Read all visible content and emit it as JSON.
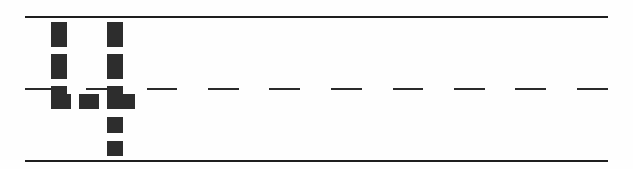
{
  "glyph": {
    "character": "4",
    "ink_color": "#2d2d2d",
    "line_color": "#1e1e1e",
    "background": "#fefefe"
  },
  "guides": {
    "top_line_y": 16,
    "midline_y": 88,
    "bottom_line_y": 160,
    "x_start": 25,
    "x_end": 608,
    "dash_style": "dashed"
  }
}
